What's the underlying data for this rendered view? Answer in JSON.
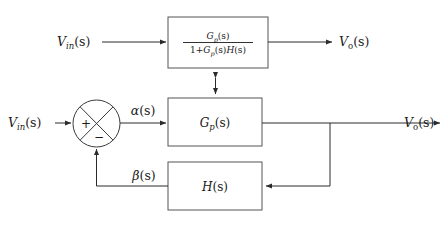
{
  "figure": {
    "background_color": "#ffffff",
    "line_color": "#2b2b2b",
    "box_border_color": "#555555",
    "text_color": "#1a1a1a"
  },
  "equivalence": {
    "symbol": "equivalence-double-arrow",
    "glyph": "⇕",
    "meaning": "equivalent-to"
  },
  "top_diagram": {
    "input_label": {
      "base": "V",
      "subscript": "in",
      "argument": "(s)",
      "full": "V_in(s)"
    },
    "output_label": {
      "base": "V",
      "subscript": "o",
      "argument": "(s)",
      "full": "V_o(s)"
    },
    "block": {
      "name": "closed-loop-transfer-function",
      "numerator": {
        "base": "G",
        "subscript": "p",
        "argument": "(s)",
        "full": "G_p(s)"
      },
      "denominator": {
        "prefix": "1+",
        "term_one": {
          "base": "G",
          "subscript": "p",
          "argument": "(s)"
        },
        "term_two": {
          "base": "H",
          "argument": "(s)"
        },
        "full": "1+G_p(s)H(s)"
      },
      "full": "G_p(s) / (1 + G_p(s)H(s))"
    }
  },
  "bottom_diagram": {
    "input_label": {
      "base": "V",
      "subscript": "in",
      "argument": "(s)",
      "full": "V_in(s)"
    },
    "output_label": {
      "base": "V",
      "subscript": "o",
      "argument": "(s)",
      "full": "V_o(s)"
    },
    "summing_junction": {
      "name": "summing-junction",
      "plus_sign": "+",
      "minus_sign": "−",
      "plus_input": "V_in(s)",
      "minus_input": "beta(s)"
    },
    "error_signal": {
      "base": "α",
      "argument": "(s)",
      "full": "α(s)"
    },
    "feedback_signal": {
      "base": "β",
      "argument": "(s)",
      "full": "β(s)"
    },
    "forward_block": {
      "name": "plant-block",
      "base": "G",
      "subscript": "p",
      "argument": "(s)",
      "full": "G_p(s)"
    },
    "feedback_block": {
      "name": "feedback-block",
      "base": "H",
      "argument": "(s)",
      "full": "H(s)"
    }
  }
}
